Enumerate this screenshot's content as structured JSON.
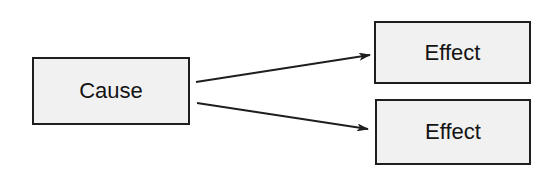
{
  "diagram": {
    "type": "cause-effect",
    "nodes": [
      {
        "id": "cause",
        "label": "Cause"
      },
      {
        "id": "effect1",
        "label": "Effect"
      },
      {
        "id": "effect2",
        "label": "Effect"
      }
    ],
    "edges": [
      {
        "from": "cause",
        "to": "effect1",
        "style": "arrow"
      },
      {
        "from": "cause",
        "to": "effect2",
        "style": "arrow"
      }
    ],
    "colors": {
      "box_fill": "#f1f1f1",
      "stroke": "#1e1e1e",
      "background": "#ffffff"
    }
  }
}
